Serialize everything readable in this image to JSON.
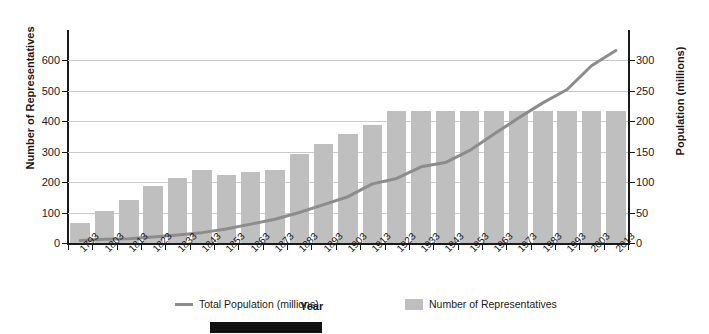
{
  "chart_data": {
    "type": "bar",
    "title": "",
    "xlabel": "Year",
    "ylabel": "Number of Representatives",
    "y2label": "Population (millions)",
    "grid": true,
    "legend_position": "bottom",
    "ylim": [
      0,
      650
    ],
    "y2lim": [
      0,
      325
    ],
    "yticks": [
      0,
      100,
      200,
      300,
      400,
      500,
      600
    ],
    "y2ticks": [
      0,
      50,
      100,
      150,
      200,
      250,
      300
    ],
    "categories": [
      "1793",
      "1803",
      "1813",
      "1823",
      "1833",
      "1843",
      "1853",
      "1863",
      "1873",
      "1883",
      "1893",
      "1903",
      "1913",
      "1923",
      "1933",
      "1943",
      "1953",
      "1963",
      "1973",
      "1983",
      "1993",
      "2003",
      "2013"
    ],
    "series": [
      {
        "name": "Number of Representatives",
        "type": "bar",
        "axis": "left",
        "color": "#bfbfbf",
        "values": [
          65,
          106,
          142,
          186,
          213,
          240,
          223,
          234,
          241,
          293,
          325,
          357,
          386,
          435,
          435,
          435,
          435,
          435,
          435,
          435,
          435,
          435,
          435
        ]
      },
      {
        "name": "Total Population (millions)",
        "type": "line",
        "axis": "right",
        "color": "#8c8c8c",
        "values": [
          4,
          6,
          7,
          10,
          13,
          17,
          23,
          31,
          39,
          50,
          63,
          76,
          97,
          106,
          125,
          132,
          152,
          179,
          205,
          230,
          252,
          291,
          316
        ]
      }
    ]
  },
  "axes": {
    "left_title": "Number of Representatives",
    "right_title": "Population (millions)",
    "x_title": "Year"
  },
  "legend": {
    "items": [
      {
        "label": "Total Population (millions)",
        "marker": "line",
        "color": "#8c8c8c"
      },
      {
        "label": "Number of Representatives",
        "marker": "swatch",
        "color": "#bfbfbf"
      }
    ]
  }
}
